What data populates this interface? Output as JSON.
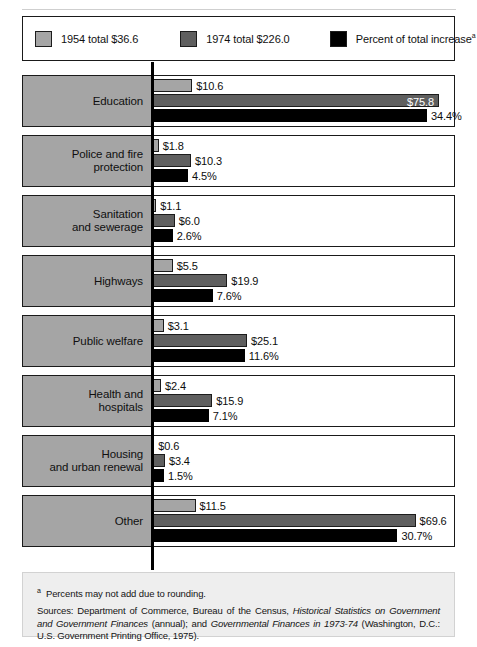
{
  "legend": {
    "items": [
      {
        "label": "1954 total $36.6",
        "color": "#a5a5a5",
        "icon": "legend-swatch-1954"
      },
      {
        "label": "1974 total $226.0",
        "color": "#5f5f5f",
        "icon": "legend-swatch-1974"
      },
      {
        "label": "Percent of total increase",
        "sup": "a",
        "color": "#000000",
        "icon": "legend-swatch-percent"
      }
    ]
  },
  "notes": {
    "footnote_marker": "a",
    "footnote": "Percents may not add due to rounding.",
    "sources_prefix": "Sources: Department of Commerce, Bureau of the Census, ",
    "sources_italic_1": "Historical Statistics on Government and Government Finances",
    "sources_mid": " (annual); and ",
    "sources_italic_2": "Governmental Finances in 1973-74",
    "sources_suffix": " (Washington, D.C.: U.S. Government Printing Office, 1975)."
  },
  "chart_data": {
    "type": "bar",
    "orientation": "horizontal",
    "layout": "small-multiples-rows",
    "title": "",
    "xlabel": "",
    "ylabel": "",
    "grid": false,
    "legend_position": "top",
    "categories": [
      "Education",
      "Police and fire protection",
      "Sanitation and sewerage",
      "Highways",
      "Public welfare",
      "Health and hospitals",
      "Housing and urban renewal",
      "Other"
    ],
    "series": [
      {
        "name": "1954 total $36.6",
        "unit": "billion dollars",
        "color": "#a5a5a5",
        "values": [
          10.6,
          1.8,
          1.1,
          5.5,
          3.1,
          2.4,
          0.6,
          11.5
        ],
        "labels": [
          "$10.6",
          "$1.8",
          "$1.1",
          "$5.5",
          "$3.1",
          "$2.4",
          "$0.6",
          "$11.5"
        ],
        "total": 36.6
      },
      {
        "name": "1974 total $226.0",
        "unit": "billion dollars",
        "color": "#5f5f5f",
        "values": [
          75.8,
          10.3,
          6.0,
          19.9,
          25.1,
          15.9,
          3.4,
          69.6
        ],
        "labels": [
          "$75.8",
          "$10.3",
          "$6.0",
          "$19.9",
          "$25.1",
          "$15.9",
          "$3.4",
          "$69.6"
        ],
        "total": 226.0
      },
      {
        "name": "Percent of total increase",
        "unit": "percent",
        "color": "#000000",
        "values": [
          34.4,
          4.5,
          2.6,
          7.6,
          11.6,
          7.1,
          1.5,
          30.7
        ],
        "labels": [
          "34.4%",
          "4.5%",
          "2.6%",
          "7.6%",
          "11.6%",
          "7.1%",
          "1.5%",
          "30.7%"
        ],
        "total": 100.0
      }
    ],
    "dollar_axis_max": 80.0,
    "percent_axis_max": 36.0,
    "rows": [
      {
        "category": "Education",
        "label_lines": [
          "Education"
        ],
        "v1954": 10.6,
        "l1954": "$10.6",
        "v1974": 75.8,
        "l1974": "$75.8",
        "l1974_inside": true,
        "vpct": 34.4,
        "lpct": "34.4%"
      },
      {
        "category": "Police and fire protection",
        "label_lines": [
          "Police and fire",
          "protection"
        ],
        "v1954": 1.8,
        "l1954": "$1.8",
        "v1974": 10.3,
        "l1974": "$10.3",
        "l1974_inside": false,
        "vpct": 4.5,
        "lpct": "4.5%"
      },
      {
        "category": "Sanitation and sewerage",
        "label_lines": [
          "Sanitation",
          "and sewerage"
        ],
        "v1954": 1.1,
        "l1954": "$1.1",
        "v1974": 6.0,
        "l1974": "$6.0",
        "l1974_inside": false,
        "vpct": 2.6,
        "lpct": "2.6%"
      },
      {
        "category": "Highways",
        "label_lines": [
          "Highways"
        ],
        "v1954": 5.5,
        "l1954": "$5.5",
        "v1974": 19.9,
        "l1974": "$19.9",
        "l1974_inside": false,
        "vpct": 7.6,
        "lpct": "7.6%"
      },
      {
        "category": "Public welfare",
        "label_lines": [
          "Public welfare"
        ],
        "v1954": 3.1,
        "l1954": "$3.1",
        "v1974": 25.1,
        "l1974": "$25.1",
        "l1974_inside": false,
        "vpct": 11.6,
        "lpct": "11.6%"
      },
      {
        "category": "Health and hospitals",
        "label_lines": [
          "Health and",
          "hospitals"
        ],
        "v1954": 2.4,
        "l1954": "$2.4",
        "v1974": 15.9,
        "l1974": "$15.9",
        "l1974_inside": false,
        "vpct": 7.1,
        "lpct": "7.1%"
      },
      {
        "category": "Housing and urban renewal",
        "label_lines": [
          "Housing",
          "and urban renewal"
        ],
        "v1954": 0.6,
        "l1954": "$0.6",
        "v1974": 3.4,
        "l1974": "$3.4",
        "l1974_inside": false,
        "vpct": 1.5,
        "lpct": "1.5%"
      },
      {
        "category": "Other",
        "label_lines": [
          "Other"
        ],
        "v1954": 11.5,
        "l1954": "$11.5",
        "v1974": 69.6,
        "l1974": "$69.6",
        "l1974_inside": false,
        "vpct": 30.7,
        "lpct": "30.7%"
      }
    ]
  }
}
